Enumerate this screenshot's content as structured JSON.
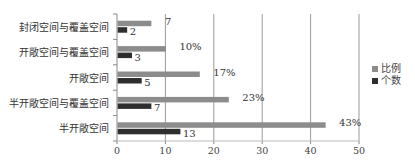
{
  "chart_data": {
    "type": "bar",
    "orientation": "horizontal",
    "title": "",
    "xlabel": "",
    "ylabel": "",
    "xlim": [
      0,
      50
    ],
    "xticks": [
      0,
      10,
      20,
      30,
      40,
      50
    ],
    "xtick_labels": [
      "0",
      "10",
      "20",
      "30",
      "40",
      "50"
    ],
    "grid": "vertical",
    "legend_position": "right",
    "categories": [
      "封闭空间与覆盖空间",
      "开敞空间与覆盖空间",
      "开敞空间",
      "半开敞空间与覆盖空间",
      "半开敞空间"
    ],
    "series": [
      {
        "name": "比例",
        "color": "#8c8c8c",
        "values": [
          7,
          10,
          17,
          23,
          43
        ],
        "labels": [
          "7",
          "10%",
          "17%",
          "23%",
          "43%"
        ]
      },
      {
        "name": "个数",
        "color": "#2e2e2e",
        "values": [
          2,
          3,
          5,
          7,
          13
        ],
        "labels": [
          "2",
          "3",
          "5",
          "7",
          "13"
        ]
      }
    ]
  }
}
